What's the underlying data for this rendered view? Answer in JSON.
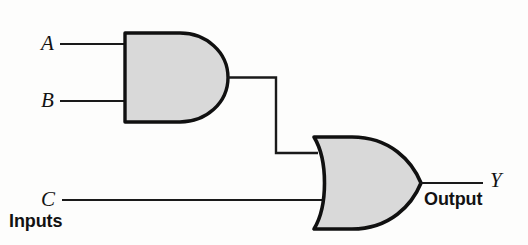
{
  "diagram": {
    "style": {
      "gate_fill": "#d9d9d9",
      "gate_stroke": "#101010",
      "wire_stroke": "#1a1a1a",
      "background": "#fdfdfc"
    },
    "labels": {
      "input_a": "A",
      "input_b": "B",
      "input_c": "C",
      "output_y": "Y",
      "inputs_group": "Inputs",
      "output_group": "Output"
    },
    "gates": [
      {
        "id": "and-gate",
        "type": "AND",
        "inputs": [
          "A",
          "B"
        ],
        "output": "A AND B"
      },
      {
        "id": "or-gate",
        "type": "OR",
        "inputs": [
          "A AND B",
          "C"
        ],
        "output": "Y"
      }
    ],
    "expression": "Y = (A AND B) OR C",
    "nets": [
      {
        "id": "wire-a",
        "from": "A",
        "to": "and-gate.in1"
      },
      {
        "id": "wire-b",
        "from": "B",
        "to": "and-gate.in2"
      },
      {
        "id": "wire-c",
        "from": "C",
        "to": "or-gate.in2"
      },
      {
        "id": "wire-and-to-or",
        "from": "and-gate.out",
        "to": "or-gate.in1"
      },
      {
        "id": "wire-y",
        "from": "or-gate.out",
        "to": "Y"
      }
    ]
  }
}
